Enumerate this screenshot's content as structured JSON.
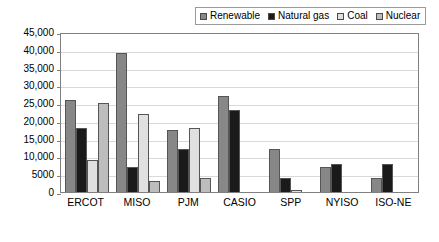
{
  "chart_data": {
    "type": "bar",
    "title": "",
    "xlabel": "",
    "ylabel": "",
    "ylim": [
      0,
      45000
    ],
    "grid": true,
    "legend_position": "top-right",
    "categories": [
      "ERCOT",
      "MISO",
      "PJM",
      "CASIO",
      "SPP",
      "NYISO",
      "ISO-NE"
    ],
    "ytick_labels": [
      "0",
      "5000",
      "10,000",
      "15,000",
      "20,000",
      "25,000",
      "30,000",
      "35,000",
      "40,000",
      "45,000"
    ],
    "ytick_values": [
      0,
      5000,
      10000,
      15000,
      20000,
      25000,
      30000,
      35000,
      40000,
      45000
    ],
    "series": [
      {
        "name": "Renewable",
        "color": "#878787",
        "values": [
          26000,
          39200,
          17500,
          27000,
          12000,
          7000,
          4000
        ]
      },
      {
        "name": "Natural gas",
        "color": "#1a1a1a",
        "values": [
          18000,
          7000,
          12000,
          23000,
          4000,
          8000,
          8000
        ]
      },
      {
        "name": "Coal",
        "color": "#e0e0e0",
        "values": [
          9000,
          22000,
          18000,
          0,
          500,
          0,
          0
        ]
      },
      {
        "name": "Nuclear",
        "color": "#bdbdbd",
        "values": [
          25000,
          3000,
          4000,
          0,
          0,
          0,
          0
        ]
      }
    ]
  }
}
